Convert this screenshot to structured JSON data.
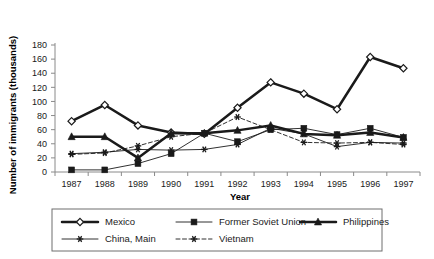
{
  "chart_data": {
    "type": "line",
    "title": "",
    "xlabel": "Year",
    "ylabel": "Number of immigrants (thousands)",
    "categories": [
      1987,
      1988,
      1989,
      1990,
      1991,
      1992,
      1993,
      1994,
      1995,
      1996,
      1997
    ],
    "x_tick_labels": [
      "1987",
      "1988",
      "1989",
      "1990",
      "1991",
      "1992",
      "1993",
      "1994",
      "1995",
      "1996",
      "1997"
    ],
    "y_tick_labels": [
      "0",
      "20",
      "40",
      "60",
      "80",
      "100",
      "120",
      "140",
      "160",
      "180"
    ],
    "ylim": [
      0,
      180
    ],
    "y_tick_step": 20,
    "grid": false,
    "legend_position": "bottom",
    "series": [
      {
        "name": "Mexico",
        "marker": "diamond-open",
        "line_style": "solid",
        "line_weight": "thick",
        "color": "#1a1a1a",
        "values": [
          72,
          95,
          66,
          56,
          54,
          91,
          127,
          111,
          89,
          163,
          147
        ]
      },
      {
        "name": "Former Soviet Union",
        "marker": "square-filled",
        "line_style": "solid",
        "line_weight": "thin",
        "color": "#1a1a1a",
        "values": [
          3,
          3,
          12,
          26,
          55,
          43,
          60,
          62,
          53,
          62,
          49
        ]
      },
      {
        "name": "Philippines",
        "marker": "triangle-filled",
        "line_style": "solid",
        "line_weight": "thick",
        "color": "#1a1a1a",
        "values": [
          50,
          50,
          20,
          55,
          55,
          59,
          66,
          54,
          52,
          56,
          49
        ]
      },
      {
        "name": "China, Main",
        "marker": "star",
        "line_style": "solid",
        "line_weight": "thin",
        "color": "#1a1a1a",
        "values": [
          26,
          28,
          32,
          31,
          32,
          39,
          62,
          54,
          36,
          42,
          41
        ]
      },
      {
        "name": "Vietnam",
        "marker": "star",
        "line_style": "dashed",
        "line_weight": "thin",
        "color": "#1a1a1a",
        "values": [
          25,
          27,
          37,
          50,
          55,
          78,
          60,
          42,
          41,
          42,
          39
        ]
      }
    ]
  },
  "legend": {
    "entries": [
      {
        "label": "Mexico"
      },
      {
        "label": "Former Soviet Union"
      },
      {
        "label": "Philippines"
      },
      {
        "label": "China, Main"
      },
      {
        "label": "Vietnam"
      }
    ]
  },
  "axes": {
    "x_title": "Year",
    "y_title": "Number of immigrants (thousands)"
  }
}
